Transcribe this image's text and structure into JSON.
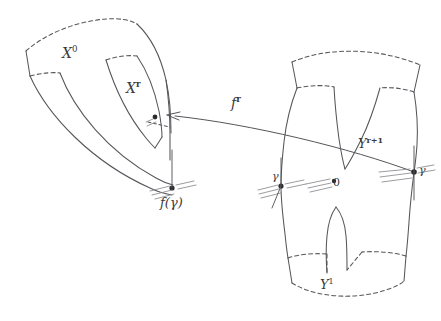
{
  "figure": {
    "kind": "mathematical-diagram",
    "stroke_color": "#55565a",
    "background_color": "#ffffff",
    "dash_pattern": "4 3"
  },
  "labels": {
    "x0": {
      "text": "X",
      "sup": "0"
    },
    "xr": {
      "text": "X",
      "sup": "r"
    },
    "fr": {
      "text": "f",
      "sup": "r"
    },
    "yr1": {
      "text": "Y",
      "sup": "r+1"
    },
    "y1": {
      "text": "Y",
      "sup": "1"
    },
    "fgamma": {
      "text": "f(γ)"
    },
    "gamma_left": {
      "text": "γ"
    },
    "zero": {
      "text": "0"
    },
    "gamma_right": {
      "text": "γ"
    }
  },
  "points": [
    {
      "name": "arrow-target-point",
      "x": 155,
      "y": 117
    },
    {
      "name": "f-gamma-point",
      "x": 172,
      "y": 188
    },
    {
      "name": "gamma-left-point",
      "x": 281,
      "y": 186
    },
    {
      "name": "zero-point",
      "x": 334,
      "y": 181
    },
    {
      "name": "gamma-right-point",
      "x": 414,
      "y": 172
    }
  ],
  "shapes": {
    "left_region": "curved band labelled X^0 containing sub-band X^r with a slit",
    "right_region": "pair-of-pants region labelled Y^{r+1} with boundary Y^1"
  }
}
